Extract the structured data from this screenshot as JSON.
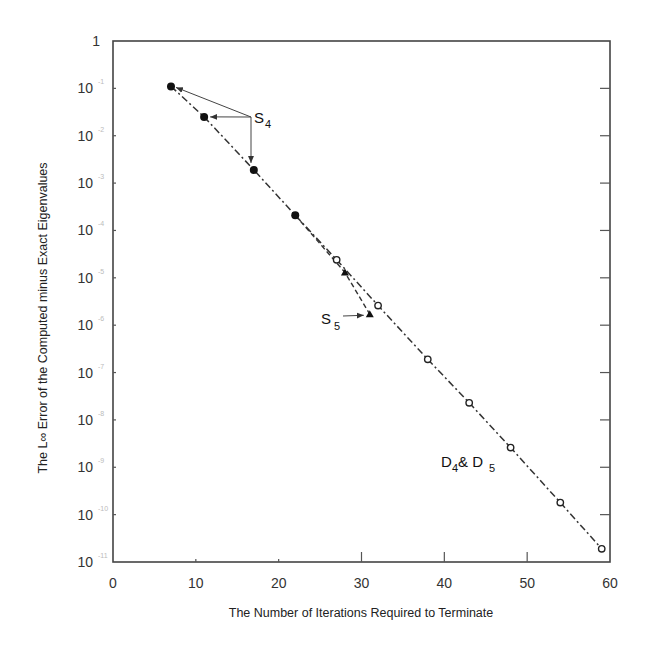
{
  "chart_data": {
    "type": "scatter",
    "title": "",
    "xlabel": "The Number of Iterations Required to Terminate",
    "ylabel": "The L∞ Error of the Computed minus Exact Eigenvalues",
    "xlim": [
      0,
      60
    ],
    "ylim": [
      1e-11,
      1
    ],
    "yscale": "log",
    "x_ticks": [
      0,
      10,
      20,
      30,
      40,
      50,
      60
    ],
    "y_ticks": [
      {
        "exp": 0,
        "label": "1",
        "sup": ""
      },
      {
        "exp": -1,
        "label": "10",
        "sup": "-1"
      },
      {
        "exp": -2,
        "label": "10",
        "sup": "-2"
      },
      {
        "exp": -3,
        "label": "10",
        "sup": "-3"
      },
      {
        "exp": -4,
        "label": "10",
        "sup": "-4"
      },
      {
        "exp": -5,
        "label": "10",
        "sup": "-5"
      },
      {
        "exp": -6,
        "label": "10",
        "sup": "-6"
      },
      {
        "exp": -7,
        "label": "10",
        "sup": "-7"
      },
      {
        "exp": -8,
        "label": "10",
        "sup": "-8"
      },
      {
        "exp": -9,
        "label": "10",
        "sup": "-9"
      },
      {
        "exp": -10,
        "label": "10",
        "sup": "-10"
      },
      {
        "exp": -11,
        "label": "10",
        "sup": "-11"
      }
    ],
    "grid": false,
    "legend": "none (inline annotations)",
    "series": [
      {
        "name": "S4",
        "marker": "filled-circle",
        "points": [
          {
            "x": 7,
            "y": 0.11
          },
          {
            "x": 11,
            "y": 0.025
          },
          {
            "x": 17,
            "y": 0.0019
          },
          {
            "x": 22,
            "y": 0.00021
          }
        ]
      },
      {
        "name": "S5",
        "marker": "filled-triangle",
        "points": [
          {
            "x": 28,
            "y": 1.3e-05
          },
          {
            "x": 31,
            "y": 1.7e-06
          }
        ]
      },
      {
        "name": "D4 & D5",
        "marker": "open-circle",
        "points": [
          {
            "x": 27,
            "y": 2.4e-05
          },
          {
            "x": 32,
            "y": 2.6e-06
          },
          {
            "x": 38,
            "y": 1.9e-07
          },
          {
            "x": 43,
            "y": 2.3e-08
          },
          {
            "x": 48,
            "y": 2.6e-09
          },
          {
            "x": 54,
            "y": 1.8e-10
          },
          {
            "x": 59,
            "y": 1.9e-11
          }
        ]
      }
    ],
    "annotations": [
      {
        "text": "S",
        "sub": "4",
        "target_series": "S4",
        "arrows_to": [
          7,
          11,
          17
        ]
      },
      {
        "text": "S",
        "sub": "5",
        "target_series": "S5",
        "arrows_to": [
          31
        ]
      },
      {
        "text": "D",
        "sub": "4",
        "text2": " & D",
        "sub2": "5",
        "target_series": "D4 & D5"
      }
    ]
  }
}
